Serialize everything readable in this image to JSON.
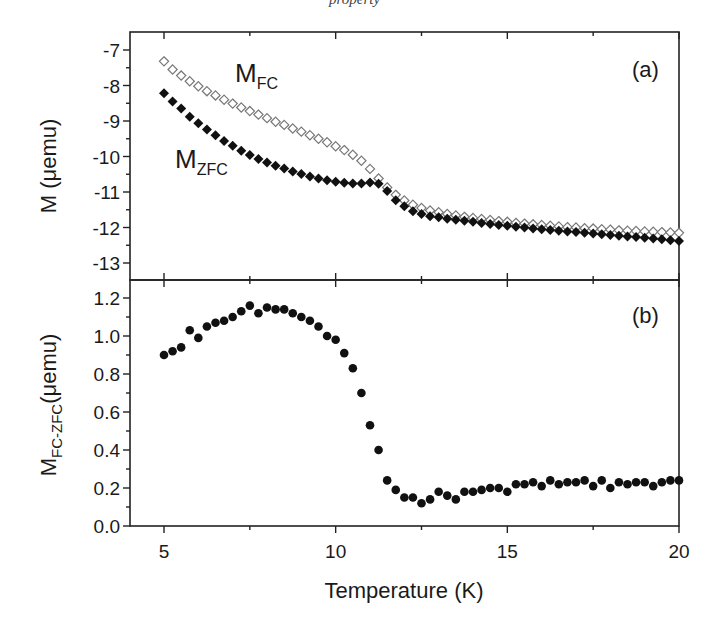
{
  "caption_fragment": "property",
  "chart_data": [
    {
      "panel": "(a)",
      "type": "scatter",
      "title": "",
      "xlabel": "Temperature (K)",
      "ylabel": "M (μemu)",
      "xlim": [
        4,
        20
      ],
      "ylim": [
        -13.5,
        -6.6
      ],
      "xticks": [
        5,
        10,
        15,
        20
      ],
      "yticks": [
        -7,
        -8,
        -9,
        -10,
        -11,
        -12,
        -13
      ],
      "grid": false,
      "legend": "inline labels",
      "annotations": [
        {
          "text": "M",
          "sub": "FC",
          "x": 7.9,
          "y": -7.6
        },
        {
          "text": "M",
          "sub": "ZFC",
          "x": 6.1,
          "y": -10.4
        }
      ],
      "series": [
        {
          "name": "M_FC",
          "marker": "open-diamond",
          "color": "#777777",
          "x": [
            5.0,
            5.25,
            5.5,
            5.75,
            6.0,
            6.25,
            6.5,
            6.75,
            7.0,
            7.25,
            7.5,
            7.75,
            8.0,
            8.25,
            8.5,
            8.75,
            9.0,
            9.25,
            9.5,
            9.75,
            10.0,
            10.25,
            10.5,
            10.75,
            11.0,
            11.25,
            11.5,
            11.75,
            12.0,
            12.25,
            12.5,
            12.75,
            13.0,
            13.25,
            13.5,
            13.75,
            14.0,
            14.25,
            14.5,
            14.75,
            15.0,
            15.25,
            15.5,
            15.75,
            16.0,
            16.25,
            16.5,
            16.75,
            17.0,
            17.25,
            17.5,
            17.75,
            18.0,
            18.25,
            18.5,
            18.75,
            19.0,
            19.25,
            19.5,
            19.75,
            20.0
          ],
          "y": [
            -7.32,
            -7.55,
            -7.72,
            -7.88,
            -8.02,
            -8.16,
            -8.28,
            -8.4,
            -8.51,
            -8.62,
            -8.72,
            -8.82,
            -8.92,
            -9.02,
            -9.11,
            -9.21,
            -9.3,
            -9.4,
            -9.5,
            -9.6,
            -9.71,
            -9.82,
            -9.95,
            -10.12,
            -10.35,
            -10.62,
            -10.87,
            -11.08,
            -11.24,
            -11.36,
            -11.45,
            -11.52,
            -11.57,
            -11.62,
            -11.66,
            -11.7,
            -11.73,
            -11.76,
            -11.79,
            -11.82,
            -11.84,
            -11.87,
            -11.89,
            -11.91,
            -11.93,
            -11.95,
            -11.97,
            -11.99,
            -12.0,
            -12.02,
            -12.03,
            -12.05,
            -12.06,
            -12.08,
            -12.09,
            -12.1,
            -12.11,
            -12.12,
            -12.13,
            -12.14,
            -12.15
          ]
        },
        {
          "name": "M_ZFC",
          "marker": "filled-diamond",
          "color": "#111111",
          "x": [
            5.0,
            5.25,
            5.5,
            5.75,
            6.0,
            6.25,
            6.5,
            6.75,
            7.0,
            7.25,
            7.5,
            7.75,
            8.0,
            8.25,
            8.5,
            8.75,
            9.0,
            9.25,
            9.5,
            9.75,
            10.0,
            10.25,
            10.5,
            10.75,
            11.0,
            11.25,
            11.5,
            11.75,
            12.0,
            12.25,
            12.5,
            12.75,
            13.0,
            13.25,
            13.5,
            13.75,
            14.0,
            14.25,
            14.5,
            14.75,
            15.0,
            15.25,
            15.5,
            15.75,
            16.0,
            16.25,
            16.5,
            16.75,
            17.0,
            17.25,
            17.5,
            17.75,
            18.0,
            18.25,
            18.5,
            18.75,
            19.0,
            19.25,
            19.5,
            19.75,
            20.0
          ],
          "y": [
            -8.22,
            -8.45,
            -8.65,
            -8.88,
            -9.06,
            -9.24,
            -9.4,
            -9.56,
            -9.7,
            -9.84,
            -9.96,
            -10.07,
            -10.17,
            -10.26,
            -10.34,
            -10.42,
            -10.49,
            -10.56,
            -10.62,
            -10.67,
            -10.71,
            -10.74,
            -10.76,
            -10.76,
            -10.73,
            -10.77,
            -10.97,
            -11.23,
            -11.4,
            -11.54,
            -11.62,
            -11.68,
            -11.71,
            -11.75,
            -11.78,
            -11.81,
            -11.84,
            -11.87,
            -11.9,
            -11.93,
            -11.95,
            -11.98,
            -12.0,
            -12.03,
            -12.05,
            -12.07,
            -12.09,
            -12.11,
            -12.13,
            -12.15,
            -12.17,
            -12.19,
            -12.21,
            -12.23,
            -12.25,
            -12.27,
            -12.29,
            -12.31,
            -12.33,
            -12.36,
            -12.38
          ]
        }
      ]
    },
    {
      "panel": "(b)",
      "type": "scatter",
      "title": "",
      "xlabel": "Temperature (K)",
      "ylabel": "M_FC-ZFC(μemu)",
      "xlim": [
        4,
        20
      ],
      "ylim": [
        0.0,
        1.3
      ],
      "xticks": [
        5,
        10,
        15,
        20
      ],
      "yticks": [
        0.0,
        0.2,
        0.4,
        0.6,
        0.8,
        1.0,
        1.2
      ],
      "grid": false,
      "series": [
        {
          "name": "M_FC-ZFC",
          "marker": "filled-circle",
          "color": "#111111",
          "x": [
            5.0,
            5.25,
            5.5,
            5.75,
            6.0,
            6.25,
            6.5,
            6.75,
            7.0,
            7.25,
            7.5,
            7.75,
            8.0,
            8.25,
            8.5,
            8.75,
            9.0,
            9.25,
            9.5,
            9.75,
            10.0,
            10.25,
            10.5,
            10.75,
            11.0,
            11.25,
            11.5,
            11.75,
            12.0,
            12.25,
            12.5,
            12.75,
            13.0,
            13.25,
            13.5,
            13.75,
            14.0,
            14.25,
            14.5,
            14.75,
            15.0,
            15.25,
            15.5,
            15.75,
            16.0,
            16.25,
            16.5,
            16.75,
            17.0,
            17.25,
            17.5,
            17.75,
            18.0,
            18.25,
            18.5,
            18.75,
            19.0,
            19.25,
            19.5,
            19.75,
            20.0
          ],
          "y": [
            0.9,
            0.92,
            0.94,
            1.03,
            0.99,
            1.05,
            1.07,
            1.08,
            1.1,
            1.13,
            1.16,
            1.12,
            1.15,
            1.14,
            1.14,
            1.12,
            1.1,
            1.08,
            1.05,
            1.0,
            0.98,
            0.91,
            0.83,
            0.7,
            0.53,
            0.4,
            0.24,
            0.19,
            0.15,
            0.15,
            0.12,
            0.14,
            0.18,
            0.16,
            0.14,
            0.18,
            0.18,
            0.19,
            0.2,
            0.2,
            0.18,
            0.22,
            0.22,
            0.23,
            0.21,
            0.24,
            0.22,
            0.23,
            0.23,
            0.24,
            0.21,
            0.24,
            0.2,
            0.23,
            0.22,
            0.23,
            0.23,
            0.21,
            0.23,
            0.24,
            0.24
          ]
        }
      ]
    }
  ]
}
